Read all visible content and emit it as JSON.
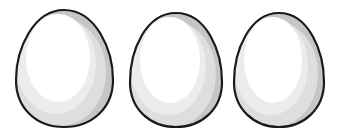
{
  "scene": {
    "description": "Three white eggs drawn side by side with dark outlines and gray shading",
    "background": "#ffffff",
    "outline_color": "#1a1a1a",
    "shade_color": "#c8c8c8",
    "mid_color": "#e4e4e4",
    "highlight_color": "#ffffff"
  },
  "eggs": [
    {
      "cx": 64,
      "cy": 70,
      "rx": 48,
      "ry": 58
    },
    {
      "cx": 176,
      "cy": 71,
      "rx": 46,
      "ry": 57
    },
    {
      "cx": 279,
      "cy": 71,
      "rx": 45,
      "ry": 57
    }
  ]
}
